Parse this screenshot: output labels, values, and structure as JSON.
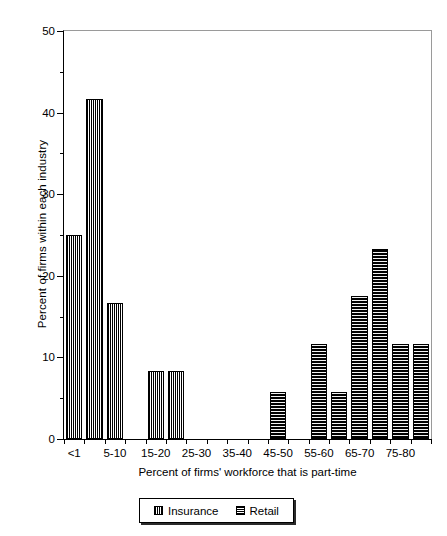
{
  "chart_data": {
    "type": "bar",
    "title": "",
    "subtitle": "",
    "xlabel": "Percent of firms' workforce that is part-time",
    "ylabel": "Percent of firms within each industry",
    "ylim": [
      0,
      50
    ],
    "yticks": [
      0,
      10,
      20,
      30,
      40,
      50
    ],
    "ytick_labels": [
      "0",
      "10",
      "20",
      "30",
      "40",
      "50"
    ],
    "yminor_ticks": [
      5,
      15,
      25,
      35,
      45
    ],
    "grid": false,
    "legend_position": "below-plot-center",
    "categories": [
      "<1",
      "1-5",
      "5-10",
      "10-15",
      "15-20",
      "20-25",
      "25-30",
      "30-35",
      "35-40",
      "40-45",
      "45-50",
      "50-55",
      "55-60",
      "60-65",
      "65-70",
      "70-75",
      "75-80",
      "80-85"
    ],
    "visible_tick_labels": [
      "<1",
      "5-10",
      "15-20",
      "25-30",
      "35-40",
      "45-50",
      "55-60",
      "65-70",
      "75-80"
    ],
    "visible_tick_label_indices": [
      0,
      2,
      4,
      6,
      8,
      10,
      12,
      14,
      16
    ],
    "series": [
      {
        "name": "Insurance",
        "pattern": "vertical-stripes",
        "color": "#000000",
        "values": [
          25.0,
          41.7,
          16.7,
          0,
          8.3,
          8.3,
          0,
          0,
          0,
          0,
          0,
          0,
          0,
          0,
          0,
          0,
          0,
          0
        ]
      },
      {
        "name": "Retail",
        "pattern": "horizontal-stripes",
        "color": "#000000",
        "values": [
          0,
          0,
          0,
          0,
          0,
          0,
          0,
          0,
          0,
          0,
          5.8,
          0,
          11.7,
          5.8,
          17.5,
          23.3,
          11.7,
          11.7
        ]
      }
    ],
    "extra_retail_bar": {
      "category": "80-85",
      "value": 11.7
    }
  },
  "legend": {
    "items": [
      {
        "label": "Insurance",
        "pattern": "vertical-stripes"
      },
      {
        "label": "Retail",
        "pattern": "horizontal-stripes"
      }
    ]
  }
}
